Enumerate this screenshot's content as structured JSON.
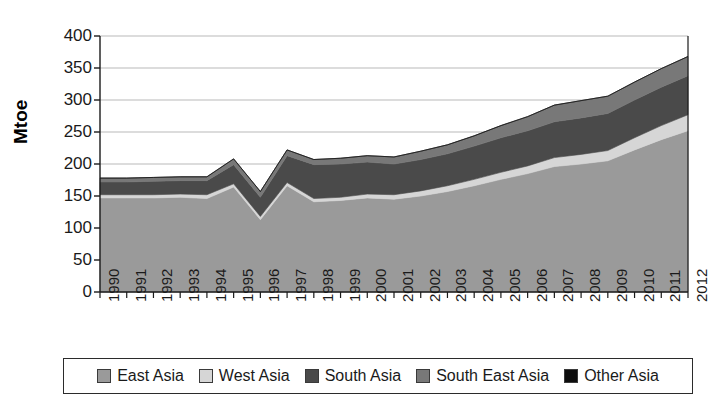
{
  "chart_data": {
    "type": "area",
    "stacked": true,
    "title": "",
    "xlabel": "",
    "ylabel": "Mtoe",
    "ylim": [
      0,
      400
    ],
    "ytick_step": 50,
    "yticks": [
      0,
      50,
      100,
      150,
      200,
      250,
      300,
      350,
      400
    ],
    "grid": true,
    "legend_position": "bottom",
    "categories": [
      "1990",
      "1991",
      "1992",
      "1993",
      "1994",
      "1995",
      "1996",
      "1997",
      "1998",
      "1999",
      "2000",
      "2001",
      "2002",
      "2003",
      "2004",
      "2005",
      "2006",
      "2007",
      "2008",
      "2009",
      "2010",
      "2011",
      "2012"
    ],
    "series": [
      {
        "name": "East Asia",
        "color": "#9a9a9a",
        "values": [
          147,
          147,
          147,
          148,
          146,
          164,
          113,
          166,
          141,
          143,
          147,
          145,
          150,
          157,
          166,
          176,
          185,
          196,
          200,
          205,
          222,
          238,
          252
        ]
      },
      {
        "name": "West Asia",
        "color": "#d6d6d6",
        "values": [
          5,
          5,
          5,
          5,
          6,
          5,
          5,
          5,
          5,
          5,
          6,
          7,
          8,
          9,
          10,
          11,
          12,
          14,
          15,
          16,
          19,
          22,
          25
        ]
      },
      {
        "name": "South Asia",
        "color": "#4a4a4a",
        "values": [
          20,
          20,
          21,
          21,
          22,
          30,
          30,
          42,
          53,
          52,
          50,
          48,
          49,
          50,
          52,
          54,
          55,
          56,
          57,
          58,
          59,
          60,
          61
        ]
      },
      {
        "name": "South East Asia",
        "color": "#787878",
        "values": [
          6,
          6,
          6,
          6,
          6,
          9,
          9,
          9,
          8,
          9,
          10,
          11,
          13,
          14,
          16,
          19,
          22,
          26,
          27,
          27,
          28,
          29,
          30
        ]
      },
      {
        "name": "Other Asia",
        "color": "#0d0d0d",
        "values": [
          0,
          0,
          0,
          0,
          0,
          0,
          0,
          0,
          0,
          0,
          0,
          0,
          0,
          0,
          0,
          0,
          0,
          0,
          0,
          0,
          0,
          0,
          0
        ]
      }
    ],
    "totals_by_year": [
      178,
      178,
      179,
      180,
      180,
      208,
      157,
      222,
      207,
      209,
      213,
      211,
      220,
      230,
      244,
      260,
      274,
      292,
      299,
      306,
      328,
      349,
      368
    ]
  },
  "legend": {
    "items": [
      {
        "label": "East Asia"
      },
      {
        "label": "West Asia"
      },
      {
        "label": "South Asia"
      },
      {
        "label": "South East Asia"
      },
      {
        "label": "Other Asia"
      }
    ]
  }
}
